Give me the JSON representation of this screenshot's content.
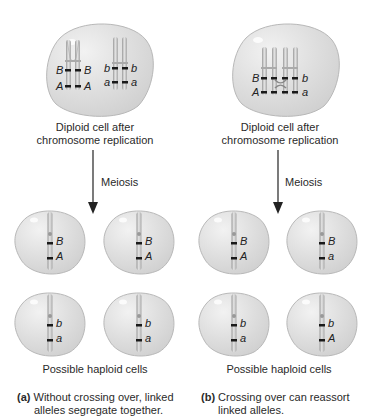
{
  "panels": {
    "a": {
      "diploid_caption_line1": "Diploid cell after",
      "diploid_caption_line2": "chromosome replication",
      "arrow_label": "Meiosis",
      "diploid_alleles": {
        "left_pair": {
          "upper_left": "B",
          "upper_right": "B",
          "lower_left": "A",
          "lower_right": "A"
        },
        "right_pair": {
          "upper_left": "b",
          "upper_right": "b",
          "lower_left": "a",
          "lower_right": "a"
        }
      },
      "haploid_cells": [
        {
          "upper": "B",
          "lower": "A"
        },
        {
          "upper": "B",
          "lower": "A"
        },
        {
          "upper": "b",
          "lower": "a"
        },
        {
          "upper": "b",
          "lower": "a"
        }
      ],
      "haploid_caption": "Possible haploid cells",
      "panel_letter": "(a)",
      "panel_caption_line1": "Without crossing over, linked",
      "panel_caption_line2": "alleles segregate together."
    },
    "b": {
      "diploid_caption_line1": "Diploid cell after",
      "diploid_caption_line2": "chromosome replication",
      "arrow_label": "Meiosis",
      "diploid_alleles": {
        "upper_left": "B",
        "upper_right": "b",
        "lower_left": "A",
        "lower_right": "a"
      },
      "haploid_cells": [
        {
          "upper": "B",
          "lower": "A"
        },
        {
          "upper": "B",
          "lower": "a"
        },
        {
          "upper": "b",
          "lower": "a"
        },
        {
          "upper": "b",
          "lower": "A"
        }
      ],
      "haploid_caption": "Possible haploid cells",
      "panel_letter": "(b)",
      "panel_caption_line1": "Crossing over can reassort",
      "panel_caption_line2": "linked alleles."
    }
  },
  "colors": {
    "cell_fill": "#dcdcdc",
    "cell_stroke": "#b5b5b5",
    "chromosome": "#c8c8c8",
    "band": "#1a1a1a",
    "arrow": "#222222"
  }
}
